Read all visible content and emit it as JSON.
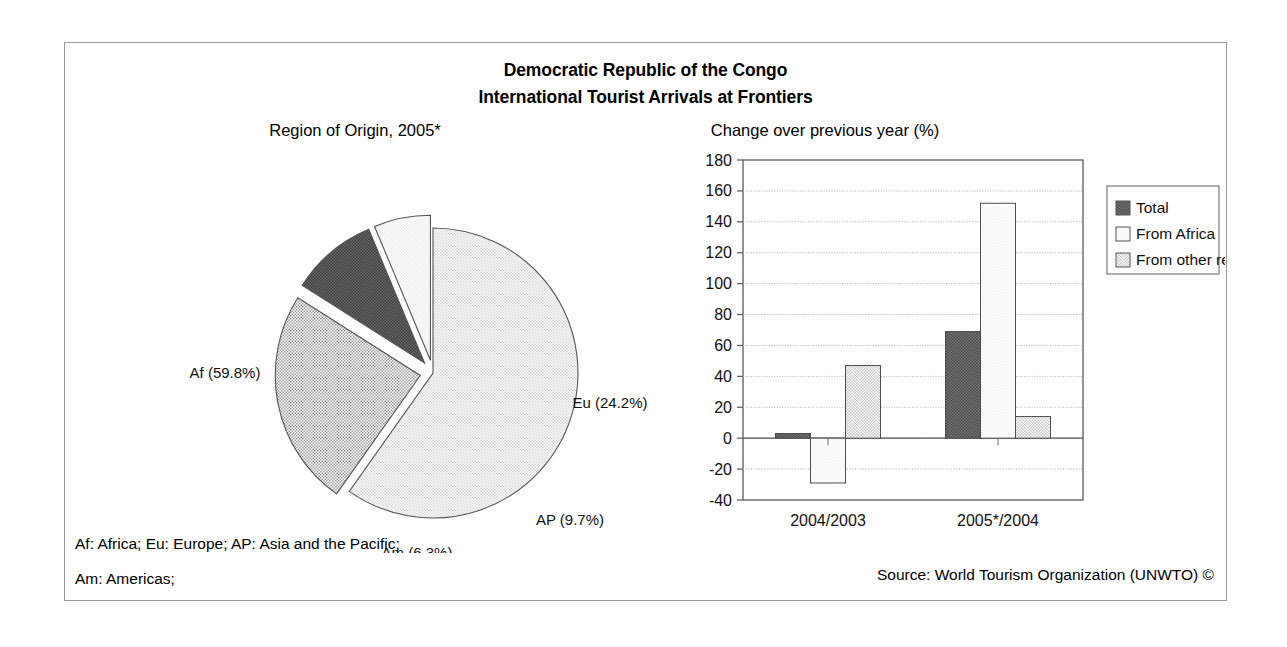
{
  "figure": {
    "title_line1": "Democratic Republic of the Congo",
    "title_line2": "International Tourist Arrivals at Frontiers",
    "footnote_line1": "Af: Africa; Eu: Europe; AP: Asia and the Pacific;",
    "footnote_line2": "Am: Americas;",
    "source": "Source: World Tourism Organization (UNWTO) ©",
    "border_color": "#9a9a9a"
  },
  "chart_data": [
    {
      "type": "pie",
      "title": "Region of Origin, 2005*",
      "labels": [
        "Af",
        "Eu",
        "AP",
        "Am"
      ],
      "values": [
        59.8,
        24.2,
        9.7,
        6.3
      ],
      "value_suffix": "%",
      "point_labels": [
        "Af (59.8%)",
        "Eu (24.2%)",
        "AP (9.7%)",
        "Am (6.3%)"
      ],
      "colors": [
        "#e4e4e4",
        "#bcbcbc",
        "#4e4e4e",
        "#efefef"
      ],
      "exploded": [
        false,
        true,
        true,
        true
      ],
      "legend": "none",
      "note": "* provisional"
    },
    {
      "type": "bar",
      "title": "Change over previous year (%)",
      "categories": [
        "2004/2003",
        "2005*/2004"
      ],
      "series": [
        {
          "name": "Total",
          "values": [
            3,
            69
          ],
          "color": "#5a5a5a"
        },
        {
          "name": "From Africa",
          "values": [
            -29,
            152
          ],
          "color": "#fbfbfb"
        },
        {
          "name": "From other regions",
          "values": [
            47,
            14
          ],
          "color": "#d2d2d2"
        }
      ],
      "ylabel": "",
      "xlabel": "",
      "ylim": [
        -40,
        180
      ],
      "ytick_step": 20,
      "yticks": [
        -40,
        -20,
        0,
        20,
        40,
        60,
        80,
        100,
        120,
        140,
        160,
        180
      ],
      "grid": true,
      "legend_position": "right"
    }
  ]
}
